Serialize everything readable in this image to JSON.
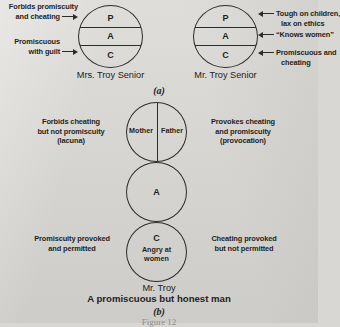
{
  "figure": {
    "caption_partial": "Figure 12",
    "panels": [
      {
        "id": "a",
        "panel_label": "(a)",
        "diagrams": [
          {
            "name": "mrs-troy-senior",
            "caption": "Mrs. Troy Senior",
            "segments": [
              {
                "key": "P",
                "label": "P"
              },
              {
                "key": "A",
                "label": "A"
              },
              {
                "key": "C",
                "label": "C"
              }
            ],
            "annotations": [
              {
                "side": "left",
                "target": "P",
                "lines": [
                  "Forbids promiscuity",
                  "and cheating"
                ]
              },
              {
                "side": "left",
                "target": "C",
                "lines": [
                  "Promiscuous",
                  "with guilt"
                ]
              }
            ]
          },
          {
            "name": "mr-troy-senior",
            "caption": "Mr. Troy Senior",
            "segments": [
              {
                "key": "P",
                "label": "P"
              },
              {
                "key": "A",
                "label": "A"
              },
              {
                "key": "C",
                "label": "C"
              }
            ],
            "annotations": [
              {
                "side": "right",
                "target": "P",
                "lines": [
                  "Tough on children,",
                  "lax on ethics"
                ]
              },
              {
                "side": "right",
                "target": "A",
                "lines": [
                  "“Knows women”"
                ]
              },
              {
                "side": "right",
                "target": "C",
                "lines": [
                  "Promiscuous and",
                  "cheating"
                ]
              }
            ]
          }
        ]
      },
      {
        "id": "b",
        "panel_label": "(b)",
        "diagram": {
          "name": "mr-troy",
          "caption_name": "Mr. Troy",
          "caption_subtitle": "A promiscuous but honest man",
          "parent_circle": {
            "left_half": "Mother",
            "right_half": "Father"
          },
          "adult_circle": {
            "label": "A"
          },
          "child_circle": {
            "label": "C",
            "sublines": [
              "Angry at",
              "women"
            ]
          },
          "annotations": [
            {
              "side": "left",
              "target": "parent",
              "lines": [
                "Forbids cheating",
                "but not promiscuity",
                "(lacuna)"
              ]
            },
            {
              "side": "right",
              "target": "parent",
              "lines": [
                "Provokes cheating",
                "and promiscuity",
                "(provocation)"
              ]
            },
            {
              "side": "left",
              "target": "child",
              "lines": [
                "Promiscuity provoked",
                "and permitted"
              ]
            },
            {
              "side": "right",
              "target": "child",
              "lines": [
                "Cheating provoked",
                "but not permitted"
              ]
            }
          ]
        }
      }
    ]
  }
}
